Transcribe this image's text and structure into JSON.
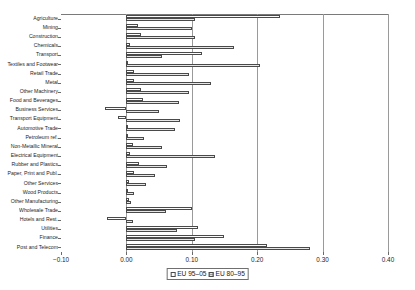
{
  "chart_data": {
    "type": "bar",
    "orientation": "horizontal",
    "title": "",
    "subtitle": "",
    "xlabel": "",
    "ylabel": "",
    "xlim": [
      -0.1,
      0.4
    ],
    "xticks": [
      -0.1,
      0.0,
      0.1,
      0.2,
      0.3,
      0.4
    ],
    "xticklabels": [
      "−0.10",
      "0.00",
      "0.10",
      "0.20",
      "0.30",
      "0.40"
    ],
    "grid": "vertical",
    "legend_position": "bottom-center",
    "legend": [
      "EU 95–05",
      "EU 80–95"
    ],
    "categories": [
      "Agriculture",
      "Mining",
      "Construction",
      "Chemicals",
      "Transport",
      "Textiles and Footwear",
      "Retail Trade",
      "Metal",
      "Other Machinery",
      "Food and Beverages",
      "Business Services",
      "Transport Equipment",
      "Automotive Trade",
      "Petroleum ref.",
      "Non-Metallic Mineral",
      "Electrical Equipment",
      "Rubber and Plastics",
      "Paper, Print and Publ.",
      "Other Services",
      "Wood Products",
      "Other Manufacturing",
      "Wholesale Trade",
      "Hotels and Rest.",
      "Utilities",
      "Finance",
      "Post and Telecom"
    ],
    "series": [
      {
        "name": "EU 95–05",
        "color": "#fdfdfd",
        "values": [
          0.235,
          0.017,
          0.023,
          0.005,
          0.115,
          0.002,
          0.012,
          0.011,
          0.023,
          0.025,
          -0.032,
          -0.013,
          0.003,
          0.003,
          0.01,
          0.006,
          0.02,
          0.012,
          0.004,
          0.003,
          0.004,
          0.1,
          -0.03,
          0.11,
          0.15,
          0.215
        ]
      },
      {
        "name": "EU 80–95",
        "color": "#9e9e9e",
        "values": [
          0.105,
          0.1,
          0.105,
          0.165,
          0.055,
          0.205,
          0.095,
          0.13,
          0.095,
          0.08,
          0.05,
          0.082,
          0.075,
          0.027,
          0.055,
          0.135,
          0.062,
          0.043,
          0.03,
          0.012,
          0.007,
          0.06,
          0.01,
          0.078,
          0.105,
          0.28
        ]
      }
    ]
  }
}
